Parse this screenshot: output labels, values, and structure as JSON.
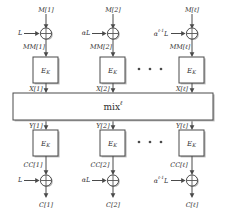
{
  "figure": {
    "name": "two-pass-blockcipher-mode-diagram",
    "background_color": "#ffffff",
    "line_color": "#4a4a4a",
    "shadow_color": "#b9b9b9",
    "text_color": "#2e2e2e"
  },
  "mix": {
    "label": "mix",
    "superscript": "ℓ"
  },
  "ellipsis": {
    "glyph": "•",
    "count": 3
  },
  "columns": [
    {
      "id": "column-1",
      "message_in": "M[1]",
      "offset_top": "L",
      "offset_top_sup": "",
      "masked_message": "MM[1]",
      "cipher_top_label": "E",
      "cipher_top_sub": "K",
      "mix_in": "X[1]",
      "mix_out": "Y[1]",
      "cipher_bottom_label": "E",
      "cipher_bottom_sub": "K",
      "masked_cipher": "CC[1]",
      "offset_bottom": "L",
      "offset_bottom_sup": "",
      "cipher_out": "C[1]"
    },
    {
      "id": "column-2",
      "message_in": "M[2]",
      "offset_top": "αL",
      "offset_top_sup": "",
      "masked_message": "MM[2]",
      "cipher_top_label": "E",
      "cipher_top_sub": "K",
      "mix_in": "X[2]",
      "mix_out": "Y[2]",
      "cipher_bottom_label": "E",
      "cipher_bottom_sub": "K",
      "masked_cipher": "CC[2]",
      "offset_bottom": "αL",
      "offset_bottom_sup": "",
      "cipher_out": "C[2]"
    },
    {
      "id": "column-last",
      "message_in": "M[ℓ]",
      "offset_top": "α",
      "offset_top_sup": "ℓ-1",
      "offset_top_tail": "L",
      "masked_message": "MM[ℓ]",
      "cipher_top_label": "E",
      "cipher_top_sub": "K",
      "mix_in": "X[ℓ]",
      "mix_out": "Y[ℓ]",
      "cipher_bottom_label": "E",
      "cipher_bottom_sub": "K",
      "masked_cipher": "CC[ℓ]",
      "offset_bottom": "α",
      "offset_bottom_sup": "ℓ-1",
      "offset_bottom_tail": "L",
      "cipher_out": "C[ℓ]"
    }
  ]
}
